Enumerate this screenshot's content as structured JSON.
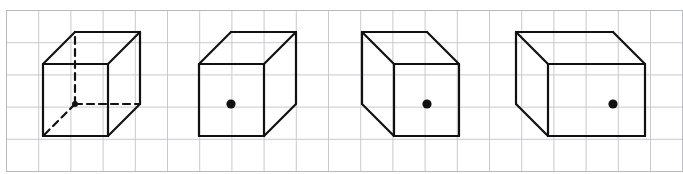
{
  "figure": {
    "width": 683,
    "height": 174,
    "background_color": "#ffffff",
    "caption": ""
  },
  "grid": {
    "name": "square-grid",
    "line_color": "#c9c9cf",
    "line_width": 1,
    "cell_size": 32.2,
    "origin_x": 6.5,
    "origin_y": 10.5,
    "columns": 21,
    "rows": 5,
    "border_color": "#b8b8c0",
    "border_width": 1,
    "visible": true
  },
  "style": {
    "stroke_color": "#111111",
    "stroke_width": 2.2,
    "dash_pattern": "7,5",
    "dot_color": "#111111",
    "dot_radius": 4.6
  },
  "chart_data": {
    "type": "diagram",
    "figure_count": 4,
    "figures": [
      {
        "index": 1,
        "label": "cube-with-hidden-edges",
        "shape": "cube",
        "projection": "oblique-up-right",
        "front_face": {
          "left": 43,
          "top": 64,
          "right": 108,
          "bottom": 136,
          "width": 65,
          "height": 72
        },
        "depth_offset": {
          "dx": 32,
          "dy": -32
        },
        "has_hidden_edges": true,
        "hidden_edge_style": "dashed",
        "hidden_vertex": {
          "x": 75,
          "y": 104
        },
        "has_dot": false,
        "dot": null,
        "description": "Cube drawn with three dashed hidden edges meeting at the rear bottom-left vertex"
      },
      {
        "index": 2,
        "label": "cube-dot-left-of-center",
        "shape": "cube",
        "projection": "oblique-up-right",
        "front_face": {
          "left": 199,
          "top": 64,
          "right": 264,
          "bottom": 136,
          "width": 65,
          "height": 72
        },
        "depth_offset": {
          "dx": 32,
          "dy": -32
        },
        "has_hidden_edges": false,
        "hidden_edge_style": "none",
        "hidden_vertex": null,
        "has_dot": true,
        "dot": {
          "x": 231,
          "y": 104,
          "location": "center of front face"
        },
        "description": "Cube with solid edges only and a dot centered on the front face"
      },
      {
        "index": 3,
        "label": "cube-dot-center-left-projection",
        "shape": "cube",
        "projection": "oblique-up-left",
        "front_face": {
          "left": 394,
          "top": 64,
          "right": 459,
          "bottom": 136,
          "width": 65,
          "height": 72
        },
        "depth_offset": {
          "dx": -32,
          "dy": -32
        },
        "has_hidden_edges": false,
        "hidden_edge_style": "none",
        "hidden_vertex": null,
        "has_dot": true,
        "dot": {
          "x": 427,
          "y": 104,
          "location": "center of front face"
        },
        "description": "Cube receding to the upper left with a dot centered on the front face"
      },
      {
        "index": 4,
        "label": "rectangular-box-dot",
        "shape": "rectangular-box",
        "projection": "oblique-up-left",
        "front_face": {
          "left": 548,
          "top": 64,
          "right": 645,
          "bottom": 136,
          "width": 97,
          "height": 72
        },
        "depth_offset": {
          "dx": -32,
          "dy": -32
        },
        "has_hidden_edges": false,
        "hidden_edge_style": "none",
        "hidden_vertex": null,
        "has_dot": true,
        "dot": {
          "x": 613,
          "y": 104,
          "location": "right of center on front face"
        },
        "description": "Wider rectangular box receding to the upper left with a dot on the front face"
      }
    ]
  }
}
